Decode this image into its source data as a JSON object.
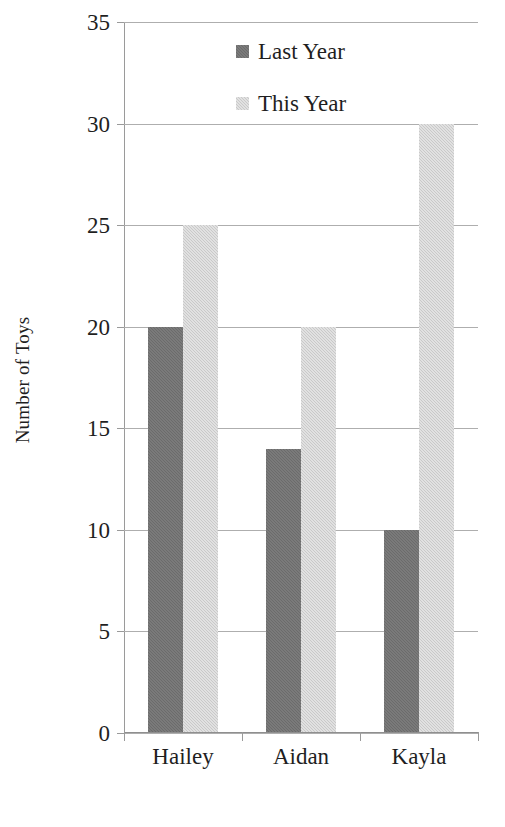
{
  "chart_data": {
    "type": "bar",
    "title": "",
    "xlabel": "",
    "ylabel": "Number of Toys",
    "categories": [
      "Hailey",
      "Aidan",
      "Kayla"
    ],
    "series": [
      {
        "name": "Last Year",
        "color": "#6b6b6b",
        "values": [
          20,
          14,
          10
        ]
      },
      {
        "name": "This Year",
        "color": "#c9c9c9",
        "values": [
          25,
          20,
          30
        ]
      }
    ],
    "ylim": [
      0,
      35
    ],
    "ytick_step": 5,
    "yticks": [
      0,
      5,
      10,
      15,
      20,
      25,
      30,
      35
    ],
    "ytick_labels": [
      "0",
      "5",
      "10",
      "15",
      "20",
      "25",
      "30",
      "35"
    ],
    "grid": true,
    "grid_axis": "y",
    "grid_color": "#aeaeae",
    "legend_position": "top-center-inside",
    "background_color": "#ffffff",
    "axis_color": "#9a9a9a"
  }
}
